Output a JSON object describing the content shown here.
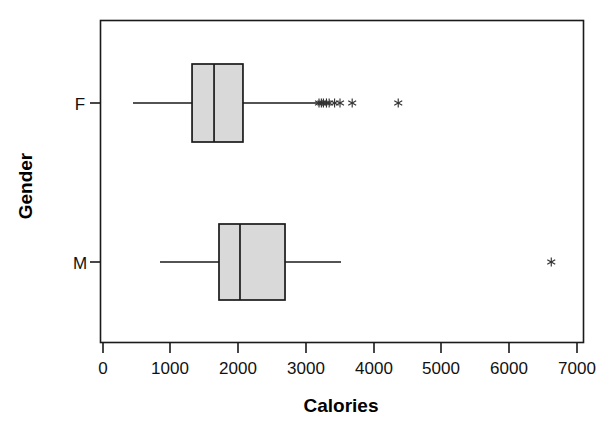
{
  "chart_data": {
    "type": "box",
    "orientation": "horizontal",
    "title": "",
    "xlabel": "Calories",
    "ylabel": "Gender",
    "xlim": [
      0,
      7100
    ],
    "xticks": [
      0,
      1000,
      2000,
      3000,
      4000,
      5000,
      6000,
      7000
    ],
    "xticklabels": [
      "0",
      "1000",
      "2000",
      "3000",
      "4000",
      "5000",
      "6000",
      "7000"
    ],
    "categories": [
      "F",
      "M"
    ],
    "grid": false,
    "legend": false,
    "boxes": [
      {
        "label": "F",
        "whisker_low": 443,
        "q1": 1315,
        "median": 1640,
        "q3": 2067,
        "whisker_high": 3175,
        "outliers": [
          3190,
          3225,
          3255,
          3300,
          3340,
          3420,
          3500,
          3680,
          4360
        ]
      },
      {
        "label": "M",
        "whisker_low": 842,
        "q1": 1713,
        "median": 2023,
        "q3": 2688,
        "whisker_high": 3515,
        "outliers": [
          6620
        ]
      }
    ]
  },
  "axis": {
    "x_title": "Calories",
    "y_title": "Gender",
    "y_tick_labels": [
      "F",
      "M"
    ],
    "x_tick_labels": [
      "0",
      "1000",
      "2000",
      "3000",
      "4000",
      "5000",
      "6000",
      "7000"
    ]
  },
  "colors": {
    "box_fill": "#d9d9d9",
    "line": "#1a1a1a",
    "outlier": "#333333",
    "background": "#ffffff"
  }
}
